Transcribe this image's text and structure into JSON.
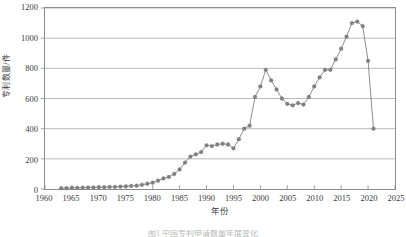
{
  "chart_data": {
    "type": "line",
    "title": "",
    "xlabel": "年份",
    "ylabel": "专利数量/件",
    "xlim": [
      1960,
      2025
    ],
    "ylim": [
      0,
      1200
    ],
    "xticks": [
      1960,
      1965,
      1970,
      1975,
      1980,
      1985,
      1990,
      1995,
      2000,
      2005,
      2010,
      2015,
      2020,
      2025
    ],
    "yticks": [
      0,
      200,
      400,
      600,
      800,
      1000,
      1200
    ],
    "xtick_labels": [
      "1960",
      "1965",
      "1970",
      "1975",
      "1980",
      "1985",
      "1990",
      "1995",
      "2000",
      "2005",
      "2010",
      "2015",
      "2020",
      "2025"
    ],
    "ytick_labels": [
      "0",
      "200",
      "400",
      "600",
      "800",
      "1000",
      "1200"
    ],
    "grid": "horizontal",
    "legend": "none",
    "marker": "circle",
    "series_color": "#808080",
    "x": [
      1963,
      1964,
      1965,
      1966,
      1967,
      1968,
      1969,
      1970,
      1971,
      1972,
      1973,
      1974,
      1975,
      1976,
      1977,
      1978,
      1979,
      1980,
      1981,
      1982,
      1983,
      1984,
      1985,
      1986,
      1987,
      1988,
      1989,
      1990,
      1991,
      1992,
      1993,
      1994,
      1995,
      1996,
      1997,
      1998,
      1999,
      2000,
      2001,
      2002,
      2003,
      2004,
      2005,
      2006,
      2007,
      2008,
      2009,
      2010,
      2011,
      2012,
      2013,
      2014,
      2015,
      2016,
      2017,
      2018,
      2019,
      2020,
      2021
    ],
    "values": [
      5,
      6,
      8,
      8,
      9,
      10,
      10,
      12,
      12,
      14,
      14,
      16,
      18,
      20,
      22,
      28,
      35,
      42,
      55,
      70,
      80,
      100,
      130,
      175,
      215,
      230,
      245,
      290,
      285,
      295,
      300,
      295,
      270,
      330,
      400,
      420,
      610,
      680,
      790,
      720,
      660,
      600,
      565,
      555,
      570,
      560,
      610,
      680,
      740,
      790,
      790,
      860,
      930,
      1010,
      1100,
      1110,
      1080,
      850,
      400
    ],
    "annotations": []
  },
  "caption": {
    "text": "图1  中国专利申请数量年度变化"
  }
}
